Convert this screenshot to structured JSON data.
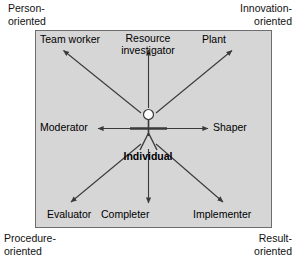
{
  "diagram": {
    "panel": {
      "fill_color": "#d6d6d6",
      "border_color": "#6d6d6d",
      "x": 35,
      "y": 30,
      "width": 237,
      "height": 198
    },
    "center_label": "Individual",
    "center_figure": "stick-figure",
    "corners": [
      {
        "id": "top-left",
        "label": "Person-\noriented"
      },
      {
        "id": "top-right",
        "label": "Innovation-\noriented"
      },
      {
        "id": "bottom-left",
        "label": "Procedure-\noriented"
      },
      {
        "id": "bottom-right",
        "label": "Result-\noriented"
      }
    ],
    "roles": [
      {
        "id": "team-worker",
        "label": "Team worker",
        "direction": "up-left"
      },
      {
        "id": "resource-investigator",
        "label": "Resource\ninvestigator",
        "direction": "up"
      },
      {
        "id": "plant",
        "label": "Plant",
        "direction": "up-right"
      },
      {
        "id": "moderator",
        "label": "Moderator",
        "direction": "left"
      },
      {
        "id": "shaper",
        "label": "Shaper",
        "direction": "right"
      },
      {
        "id": "evaluator",
        "label": "Evaluator",
        "direction": "down-left"
      },
      {
        "id": "completer",
        "label": "Completer",
        "direction": "down"
      },
      {
        "id": "implementer",
        "label": "Implementer",
        "direction": "down-right"
      }
    ],
    "colors": {
      "panel_fill": "#d6d6d6",
      "panel_border": "#6d6d6d",
      "arrow": "#3a3a3a",
      "text": "#000000",
      "page_background": "#ffffff"
    }
  }
}
